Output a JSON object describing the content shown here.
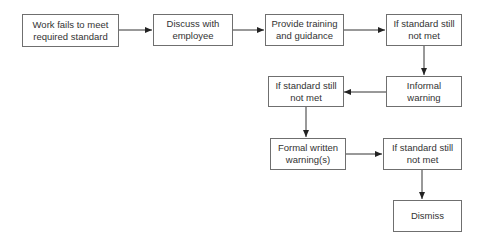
{
  "diagram": {
    "type": "flowchart",
    "nodes": [
      {
        "id": "n1",
        "label": "Work fails to meet\nrequired standard"
      },
      {
        "id": "n2",
        "label": "Discuss with\nemployee"
      },
      {
        "id": "n3",
        "label": "Provide training\nand guidance"
      },
      {
        "id": "n4",
        "label": "If standard still\nnot met"
      },
      {
        "id": "n5",
        "label": "Informal\nwarning"
      },
      {
        "id": "n6",
        "label": "If standard still\nnot met"
      },
      {
        "id": "n7",
        "label": "Formal written\nwarning(s)"
      },
      {
        "id": "n8",
        "label": "If standard still\nnot met"
      },
      {
        "id": "n9",
        "label": "Dismiss"
      }
    ],
    "edges": [
      {
        "from": "n1",
        "to": "n2"
      },
      {
        "from": "n2",
        "to": "n3"
      },
      {
        "from": "n3",
        "to": "n4"
      },
      {
        "from": "n4",
        "to": "n5"
      },
      {
        "from": "n5",
        "to": "n6"
      },
      {
        "from": "n6",
        "to": "n7"
      },
      {
        "from": "n7",
        "to": "n8"
      },
      {
        "from": "n8",
        "to": "n9"
      }
    ],
    "colors": {
      "border": "#6f6f6f",
      "line": "#333333",
      "text": "#333333"
    }
  }
}
